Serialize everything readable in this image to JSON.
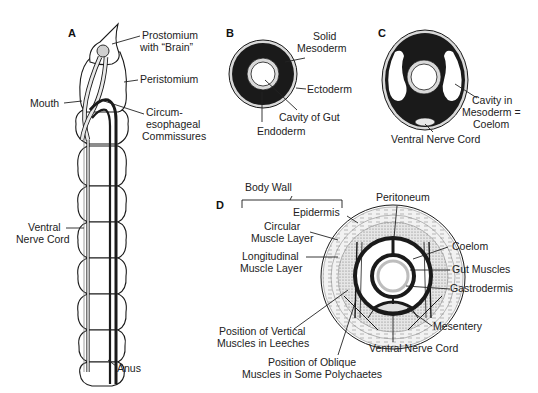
{
  "figure": {
    "panels": {
      "A": {
        "letter": "A",
        "labels": {
          "prostomium_1": "Prostomium",
          "prostomium_2": "with “Brain”",
          "peristomium": "Peristomium",
          "mouth": "Mouth",
          "circum_1": "Circum-",
          "circum_2": "esophageal",
          "circum_3": "Commissures",
          "vnc_1": "Ventral",
          "vnc_2": "Nerve Cord",
          "anus": "Anus"
        },
        "segments": 10
      },
      "B": {
        "letter": "B",
        "labels": {
          "solid_1": "Solid",
          "solid_2": "Mesoderm",
          "ectoderm": "Ectoderm",
          "cavity": "Cavity of Gut",
          "endoderm": "Endoderm"
        }
      },
      "C": {
        "letter": "C",
        "labels": {
          "cavity_1": "Cavity in",
          "cavity_2": "Mesoderm =",
          "cavity_3": "Coelom",
          "vnc": "Ventral Nerve Cord"
        }
      },
      "D": {
        "letter": "D",
        "labels": {
          "body_wall": "Body Wall",
          "epidermis": "Epidermis",
          "circular_1": "Circular",
          "circular_2": "Muscle Layer",
          "longitudinal_1": "Longitudinal",
          "longitudinal_2": "Muscle Layer",
          "peritoneum": "Peritoneum",
          "coelom": "Coelom",
          "gut_muscles": "Gut Muscles",
          "gastrodermis": "Gastrodermis",
          "mesentery": "Mesentery",
          "vnc": "Ventral Nerve Cord",
          "vertical_1": "Position of Vertical",
          "vertical_2": "Muscles in Leeches",
          "oblique_1": "Position of Oblique",
          "oblique_2": "Muscles in Some Polychaetes"
        }
      }
    },
    "colors": {
      "ink": "#1a1a1a",
      "light_gray": "#d9d9d9",
      "mid_gray": "#bdbdbd",
      "paper": "#ffffff"
    }
  }
}
